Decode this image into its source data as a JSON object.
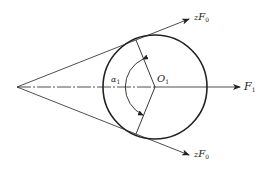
{
  "diagram": {
    "labels": {
      "top_force": {
        "prefix": "z",
        "main": "F",
        "sub": "0"
      },
      "bottom_force": {
        "prefix": "z",
        "main": "F",
        "sub": "0"
      },
      "radial_force": {
        "main": "F",
        "sub": "1"
      },
      "center": {
        "main": "O",
        "sub": "1"
      },
      "angle": {
        "main": "α",
        "sub": "1"
      }
    },
    "colors": {
      "stroke": "#222222",
      "background": "#ffffff"
    }
  }
}
